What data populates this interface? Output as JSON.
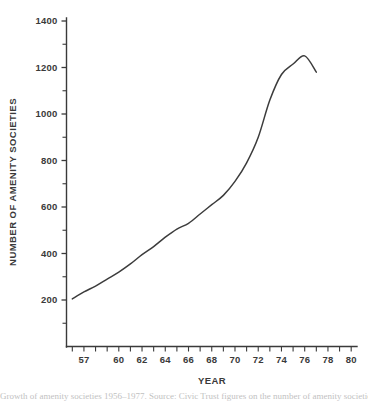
{
  "chart_data": {
    "type": "line",
    "title": "",
    "xlabel": "YEAR",
    "ylabel": "NUMBER OF AMENITY SOCIETIES",
    "xlim": [
      1955.5,
      1980.5
    ],
    "ylim": [
      0,
      1450
    ],
    "grid": false,
    "legend": null,
    "x_tick_labels": [
      "57",
      "60",
      "62",
      "64",
      "66",
      "68",
      "70",
      "72",
      "74",
      "76",
      "78",
      "80"
    ],
    "x_tick_values": [
      1957,
      1960,
      1962,
      1964,
      1966,
      1968,
      1970,
      1972,
      1974,
      1976,
      1978,
      1980
    ],
    "x_minor_ticks": [
      1956,
      1957,
      1958,
      1959,
      1960,
      1961,
      1962,
      1963,
      1964,
      1965,
      1966,
      1967,
      1968,
      1969,
      1970,
      1971,
      1972,
      1973,
      1974,
      1975,
      1976,
      1977,
      1978,
      1979,
      1980
    ],
    "y_tick_labels": [
      "200",
      "400",
      "600",
      "800",
      "1000",
      "1200",
      "1400"
    ],
    "y_tick_values": [
      200,
      400,
      600,
      800,
      1000,
      1200,
      1400
    ],
    "y_minor_ticks": [
      100,
      300,
      500,
      700,
      900,
      1100,
      1300
    ],
    "series": [
      {
        "name": "Number of amenity societies",
        "color": "#3c3c3c",
        "x": [
          1956,
          1957,
          1958,
          1959,
          1960,
          1961,
          1962,
          1963,
          1964,
          1965,
          1966,
          1967,
          1968,
          1969,
          1970,
          1971,
          1972,
          1973,
          1974,
          1975,
          1976,
          1977
        ],
        "values": [
          205,
          235,
          260,
          290,
          320,
          355,
          395,
          430,
          470,
          505,
          530,
          570,
          610,
          650,
          710,
          790,
          900,
          1060,
          1170,
          1215,
          1250,
          1180
        ]
      }
    ]
  },
  "caption": {
    "text": "Growth of amenity societies 1956–1977. Source: Civic Trust figures on the number of amenity societies registered."
  },
  "colors": {
    "line": "#3c3c3c",
    "axis": "#3a3a3a",
    "text": "#3a3a3a",
    "background": "#ffffff"
  }
}
